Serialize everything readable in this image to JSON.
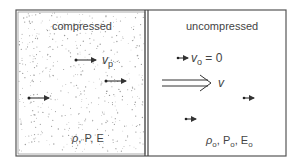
{
  "regions": {
    "left": {
      "title": "compressed",
      "state_label_rho": "ρ",
      "state_label_rest": ", P, E",
      "velocity_symbol": "v",
      "velocity_subscript": "p"
    },
    "right": {
      "title": "uncompressed",
      "velocity_symbol": "v",
      "velocity_subscript": "o",
      "velocity_value": " = 0",
      "state_rho": "ρ",
      "state_sub1": "o",
      "state_P": ", P",
      "state_sub2": "o",
      "state_E": ", E",
      "state_sub3": "o"
    }
  },
  "shock_front": {
    "velocity_label": "v"
  },
  "colors": {
    "line": "#444444",
    "stipple": "#9a9a9a"
  }
}
